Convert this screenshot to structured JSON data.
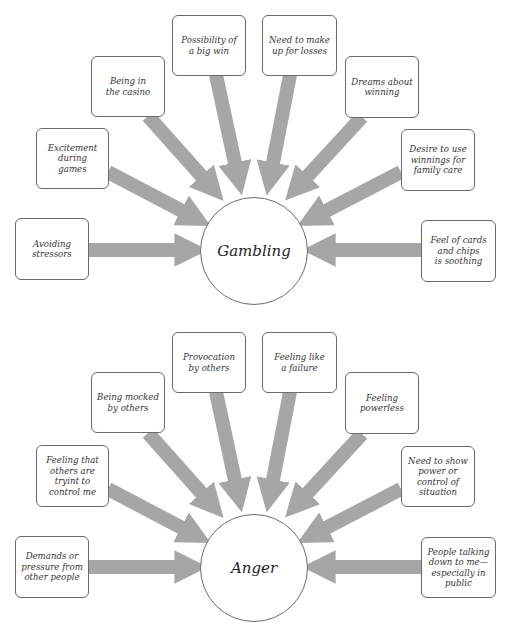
{
  "colors": {
    "arrow": "#a6a6a6",
    "box_border": "#6a6a6a",
    "text": "#333333",
    "background": "#ffffff"
  },
  "diagrams": [
    {
      "center": "Gambling",
      "triggers": [
        "Avoiding\nstressors",
        "Excitement\nduring\ngames",
        "Being in\nthe casino",
        "Possibility of\na big win",
        "Need to make\nup for losses",
        "Dreams about\nwinning",
        "Desire to use\nwinnings for\nfamily care",
        "Feel of cards\nand chips\nis soothing"
      ]
    },
    {
      "center": "Anger",
      "triggers": [
        "Demands or\npressure from\nother people",
        "Feeling that\nothers are\ntryint to\ncontrol me",
        "Being mocked\nby others",
        "Provocation\nby others",
        "Feeling like\na failure",
        "Feeling\npowerless",
        "Need to show\npower or\ncontrol of\nsituation",
        "People talking\ndown to me—\nespecially in\npublic"
      ]
    }
  ]
}
